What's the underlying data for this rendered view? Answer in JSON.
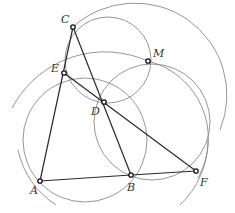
{
  "diagram": {
    "type": "geometry-construction",
    "points": [
      {
        "id": "A",
        "label": "A",
        "x": 40,
        "y": 181,
        "lx": 30,
        "ly": 194
      },
      {
        "id": "B",
        "label": "B",
        "x": 131,
        "y": 175,
        "lx": 127,
        "ly": 191
      },
      {
        "id": "C",
        "label": "C",
        "x": 73,
        "y": 27,
        "lx": 61,
        "ly": 23
      },
      {
        "id": "D",
        "label": "D",
        "x": 104,
        "y": 102,
        "lx": 91,
        "ly": 115
      },
      {
        "id": "E",
        "label": "E",
        "x": 64,
        "y": 73,
        "lx": 51,
        "ly": 72
      },
      {
        "id": "F",
        "label": "F",
        "x": 196,
        "y": 171,
        "lx": 200,
        "ly": 186
      },
      {
        "id": "M",
        "label": "M",
        "x": 148,
        "y": 61,
        "lx": 153,
        "ly": 57
      }
    ],
    "segments": [
      {
        "from": "A",
        "to": "C"
      },
      {
        "from": "C",
        "to": "B"
      },
      {
        "from": "A",
        "to": "B"
      },
      {
        "from": "B",
        "to": "F"
      },
      {
        "from": "E",
        "to": "F"
      }
    ],
    "circles": [
      {
        "name": "circle-CEDM",
        "cx": 108,
        "cy": 60,
        "r": 43
      },
      {
        "name": "circle-AEDB",
        "cx": 85,
        "cy": 140,
        "r": 62
      },
      {
        "name": "circle-BDMF",
        "cx": 152,
        "cy": 122,
        "r": 58
      },
      {
        "name": "arc-left-large",
        "d": "M 12 108 A 105 105 0 0 1 150 62"
      },
      {
        "name": "arc-right-large",
        "d": "M 73 27 A 92 92 0 0 1 220 130"
      },
      {
        "name": "arc-right-mid",
        "d": "M 148 61 A 80 80 0 0 1 198 178"
      },
      {
        "name": "arc-A-lower",
        "d": "M 18 150 A 90 90 0 0 0 56 205"
      },
      {
        "name": "arc-F-lower",
        "d": "M 208 140 A 90 90 0 0 1 180 205"
      }
    ]
  }
}
